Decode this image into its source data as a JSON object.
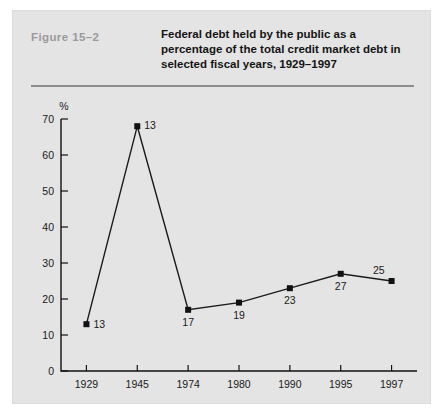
{
  "figure": {
    "number": "Figure  15–2",
    "title": "Federal debt held by the public as a percentage of the total credit market debt in selected fiscal years, 1929–1997",
    "unit_label": "%"
  },
  "colors": {
    "panel_background": "#e4e4e4",
    "page_background": "#ffffff",
    "figure_number": "#9a9a9a",
    "title_text": "#141414",
    "rule": "#8d8d8d",
    "line": "#1a1a1a",
    "marker": "#111111",
    "axis": "#111111"
  },
  "chart_data": {
    "type": "line",
    "title": "Federal debt held by the public as a percentage of the total credit market debt in selected fiscal years, 1929–1997",
    "xlabel": "",
    "ylabel": "%",
    "categories": [
      "1929",
      "1945",
      "1974",
      "1980",
      "1990",
      "1995",
      "1997"
    ],
    "values": [
      13,
      68,
      17,
      19,
      23,
      27,
      25
    ],
    "point_labels": [
      "13",
      "13",
      "17",
      "19",
      "23",
      "27",
      "25"
    ],
    "label_positions": [
      "right",
      "above-right",
      "below",
      "below",
      "below",
      "below",
      "above-left"
    ],
    "ylim": [
      0,
      70
    ],
    "yticks": [
      0,
      10,
      20,
      30,
      40,
      50,
      60,
      70
    ],
    "ytick_labels": [
      "0",
      "10",
      "20",
      "30",
      "40",
      "50",
      "60",
      "70"
    ],
    "grid": false,
    "legend": "none",
    "marker": "square"
  }
}
